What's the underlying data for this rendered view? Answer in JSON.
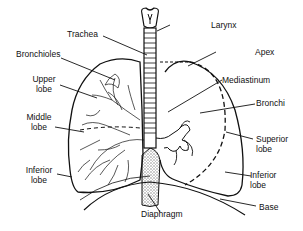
{
  "diagram": {
    "labels": {
      "trachea": "Trachea",
      "larynx": "Larynx",
      "bronchioles": "Bronchioles",
      "apex": "Apex",
      "upper_lobe": [
        "Upper",
        "lobe"
      ],
      "mediastinum": "Mediastinum",
      "bronchi": "Bronchi",
      "middle_lobe": [
        "Middle",
        "lobe"
      ],
      "superior_lobe": [
        "Superior",
        "lobe"
      ],
      "inferior_lobe_left": [
        "Inferior",
        "lobe"
      ],
      "inferior_lobe_right": [
        "Inferior",
        "lobe"
      ],
      "diaphragm": "Diaphragm",
      "base": "Base"
    },
    "colors": {
      "line": "#111111",
      "background": "#ffffff",
      "shading": "#bbbbbb"
    }
  }
}
